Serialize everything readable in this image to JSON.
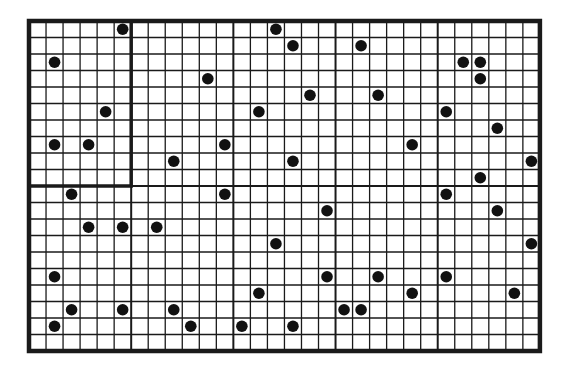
{
  "diagram": {
    "type": "dot-grid",
    "columns": 30,
    "rows": 20,
    "origin": {
      "x": 29,
      "y": 21
    },
    "cell_width": 17.03,
    "cell_height": 16.5,
    "major_every_cols": 6,
    "major_every_rows": 10,
    "colors": {
      "line": "#1a1a1a",
      "dot": "#111111",
      "background": "#ffffff"
    },
    "highlight_block": {
      "col": 0,
      "row": 0,
      "cols": 6,
      "rows": 10
    },
    "dot_count": 49,
    "dots": [
      {
        "c": 5,
        "r": 0
      },
      {
        "c": 1,
        "r": 2
      },
      {
        "c": 4,
        "r": 5
      },
      {
        "c": 1,
        "r": 7
      },
      {
        "c": 3,
        "r": 7
      },
      {
        "c": 14,
        "r": 0
      },
      {
        "c": 15,
        "r": 1
      },
      {
        "c": 19,
        "r": 1
      },
      {
        "c": 10,
        "r": 3
      },
      {
        "c": 25,
        "r": 2
      },
      {
        "c": 26,
        "r": 2
      },
      {
        "c": 26,
        "r": 3
      },
      {
        "c": 16,
        "r": 4
      },
      {
        "c": 20,
        "r": 4
      },
      {
        "c": 13,
        "r": 5
      },
      {
        "c": 24,
        "r": 5
      },
      {
        "c": 27,
        "r": 6
      },
      {
        "c": 11,
        "r": 7
      },
      {
        "c": 22,
        "r": 7
      },
      {
        "c": 8,
        "r": 8
      },
      {
        "c": 15,
        "r": 8
      },
      {
        "c": 29,
        "r": 8
      },
      {
        "c": 26,
        "r": 9
      },
      {
        "c": 2,
        "r": 10
      },
      {
        "c": 11,
        "r": 10
      },
      {
        "c": 24,
        "r": 10
      },
      {
        "c": 17,
        "r": 11
      },
      {
        "c": 27,
        "r": 11
      },
      {
        "c": 3,
        "r": 12
      },
      {
        "c": 5,
        "r": 12
      },
      {
        "c": 7,
        "r": 12
      },
      {
        "c": 14,
        "r": 13
      },
      {
        "c": 29,
        "r": 13
      },
      {
        "c": 1,
        "r": 15
      },
      {
        "c": 17,
        "r": 15
      },
      {
        "c": 20,
        "r": 15
      },
      {
        "c": 24,
        "r": 15
      },
      {
        "c": 13,
        "r": 16
      },
      {
        "c": 22,
        "r": 16
      },
      {
        "c": 28,
        "r": 16
      },
      {
        "c": 2,
        "r": 17
      },
      {
        "c": 5,
        "r": 17
      },
      {
        "c": 8,
        "r": 17
      },
      {
        "c": 18,
        "r": 17
      },
      {
        "c": 19,
        "r": 17
      },
      {
        "c": 1,
        "r": 18
      },
      {
        "c": 9,
        "r": 18
      },
      {
        "c": 12,
        "r": 18
      },
      {
        "c": 15,
        "r": 18
      }
    ]
  }
}
